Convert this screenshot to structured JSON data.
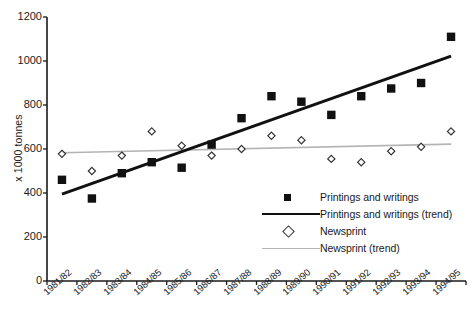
{
  "chart_data": {
    "type": "scatter",
    "title": "",
    "xlabel": "",
    "ylabel": "x 1000 tonnes",
    "ylim": [
      0,
      1200
    ],
    "yticks": [
      0,
      200,
      400,
      600,
      800,
      1000,
      1200
    ],
    "grid": false,
    "legend_position": "inside-lower-right",
    "categories": [
      "1981/82",
      "1982/83",
      "1983/84",
      "1984/85",
      "1985/86",
      "1986/87",
      "1987/88",
      "1988/89",
      "1989/90",
      "1990/91",
      "1991/92",
      "1992/93",
      "1993/94",
      "1994/95"
    ],
    "series": [
      {
        "name": "Printings and writings",
        "marker": "filled-square",
        "color": "#111111",
        "values": [
          460,
          375,
          490,
          540,
          515,
          620,
          740,
          840,
          815,
          755,
          840,
          875,
          900,
          1110
        ]
      },
      {
        "name": "Printings and writings (trend)",
        "marker": "line",
        "color": "#111111",
        "values": [
          395,
          443,
          491,
          540,
          588,
          636,
          684,
          733,
          781,
          829,
          877,
          926,
          974,
          1022
        ]
      },
      {
        "name": "Newsprint",
        "marker": "open-diamond",
        "color": "#333333",
        "values": [
          578,
          500,
          570,
          680,
          615,
          570,
          600,
          660,
          640,
          555,
          540,
          590,
          610,
          680
        ]
      },
      {
        "name": "Newsprint (trend)",
        "marker": "line",
        "color": "#b4b4b4",
        "values": [
          583,
          586,
          589,
          592,
          595,
          598,
          601,
          604,
          607,
          610,
          613,
          616,
          619,
          622
        ]
      }
    ]
  },
  "legend": {
    "items": [
      {
        "label": "Printings and writings",
        "mark": "filled-square"
      },
      {
        "label": "Printings and writings (trend)",
        "mark": "dark-line"
      },
      {
        "label": "Newsprint",
        "mark": "open-diamond"
      },
      {
        "label": "Newsprint (trend)",
        "mark": "light-line"
      }
    ]
  },
  "axes": {
    "y_title": "x 1000 tonnes",
    "y_labels": [
      "1200",
      "1000",
      "800",
      "600",
      "400",
      "200",
      "0"
    ]
  }
}
